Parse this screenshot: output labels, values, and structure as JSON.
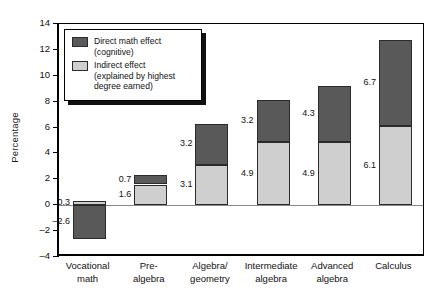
{
  "chart_data": {
    "type": "bar",
    "subtype": "stacked-bar",
    "title": "",
    "xlabel": "",
    "ylabel": "Percentage",
    "ylim": [
      -4,
      14
    ],
    "ytick_step": 2,
    "yticks": [
      "14",
      "12",
      "10",
      "8",
      "6",
      "4",
      "2",
      "0",
      "-2",
      "-4"
    ],
    "grid": false,
    "legend_position": "top-left-inside",
    "categories": [
      "Vocational math",
      "Pre-algebra",
      "Algebra/ geometry",
      "Intermediate algebra",
      "Advanced algebra",
      "Calculus"
    ],
    "category_lines": [
      [
        "Vocational",
        "math"
      ],
      [
        "Pre-",
        "algebra"
      ],
      [
        "Algebra/",
        "geometry"
      ],
      [
        "Intermediate",
        "algebra"
      ],
      [
        "Advanced",
        "algebra"
      ],
      [
        "Calculus",
        ""
      ]
    ],
    "series": [
      {
        "name": "Indirect effect (explained by highest degree earned)",
        "color": "#cfcfcf",
        "values": [
          0.3,
          1.6,
          3.1,
          4.9,
          4.9,
          6.1
        ],
        "labels": [
          "0.3",
          "1.6",
          "3.1",
          "4.9",
          "4.9",
          "6.1"
        ]
      },
      {
        "name": "Direct math effect (cognitive)",
        "color": "#595959",
        "values": [
          -2.6,
          0.7,
          3.2,
          3.2,
          4.3,
          6.7
        ],
        "labels": [
          "-2.6",
          "0.7",
          "3.2",
          "3.2",
          "4.3",
          "6.7"
        ]
      }
    ],
    "totals": [
      -2.3,
      2.3,
      6.3,
      8.1,
      9.2,
      12.8
    ]
  },
  "legend": {
    "items": [
      {
        "swatch": "dark",
        "line1": "Direct math effect",
        "line2": "(cognitive)"
      },
      {
        "swatch": "light",
        "line1": "Indirect effect",
        "line2": "(explained by highest",
        "line3": "degree earned)"
      }
    ]
  },
  "colors": {
    "direct": "#595959",
    "indirect": "#cfcfcf",
    "axis": "#000000",
    "zeroline": "#8a8a8a",
    "text": "#111111"
  }
}
